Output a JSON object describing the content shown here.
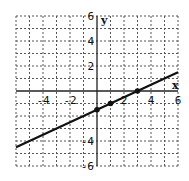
{
  "chart_data": {
    "type": "line",
    "title": "",
    "xlabel": "x",
    "ylabel": "y",
    "xlim": [
      -6,
      6
    ],
    "ylim": [
      -6,
      6
    ],
    "grid": true,
    "grid_style": "dotted",
    "x_ticks": [
      -4,
      -2,
      2,
      4,
      6
    ],
    "y_ticks": [
      6,
      4,
      2,
      -4,
      -6
    ],
    "series": [
      {
        "name": "line",
        "equation": "y = 0.5x - 1.5",
        "x": [
          -6,
          6
        ],
        "y": [
          -4.5,
          1.5
        ]
      }
    ],
    "points": [
      {
        "x": 0,
        "y": -1.5
      },
      {
        "x": 1,
        "y": -1
      },
      {
        "x": 3,
        "y": 0
      }
    ]
  },
  "colors": {
    "line": "#111111",
    "grid": "#555555",
    "axis": "#222222"
  }
}
